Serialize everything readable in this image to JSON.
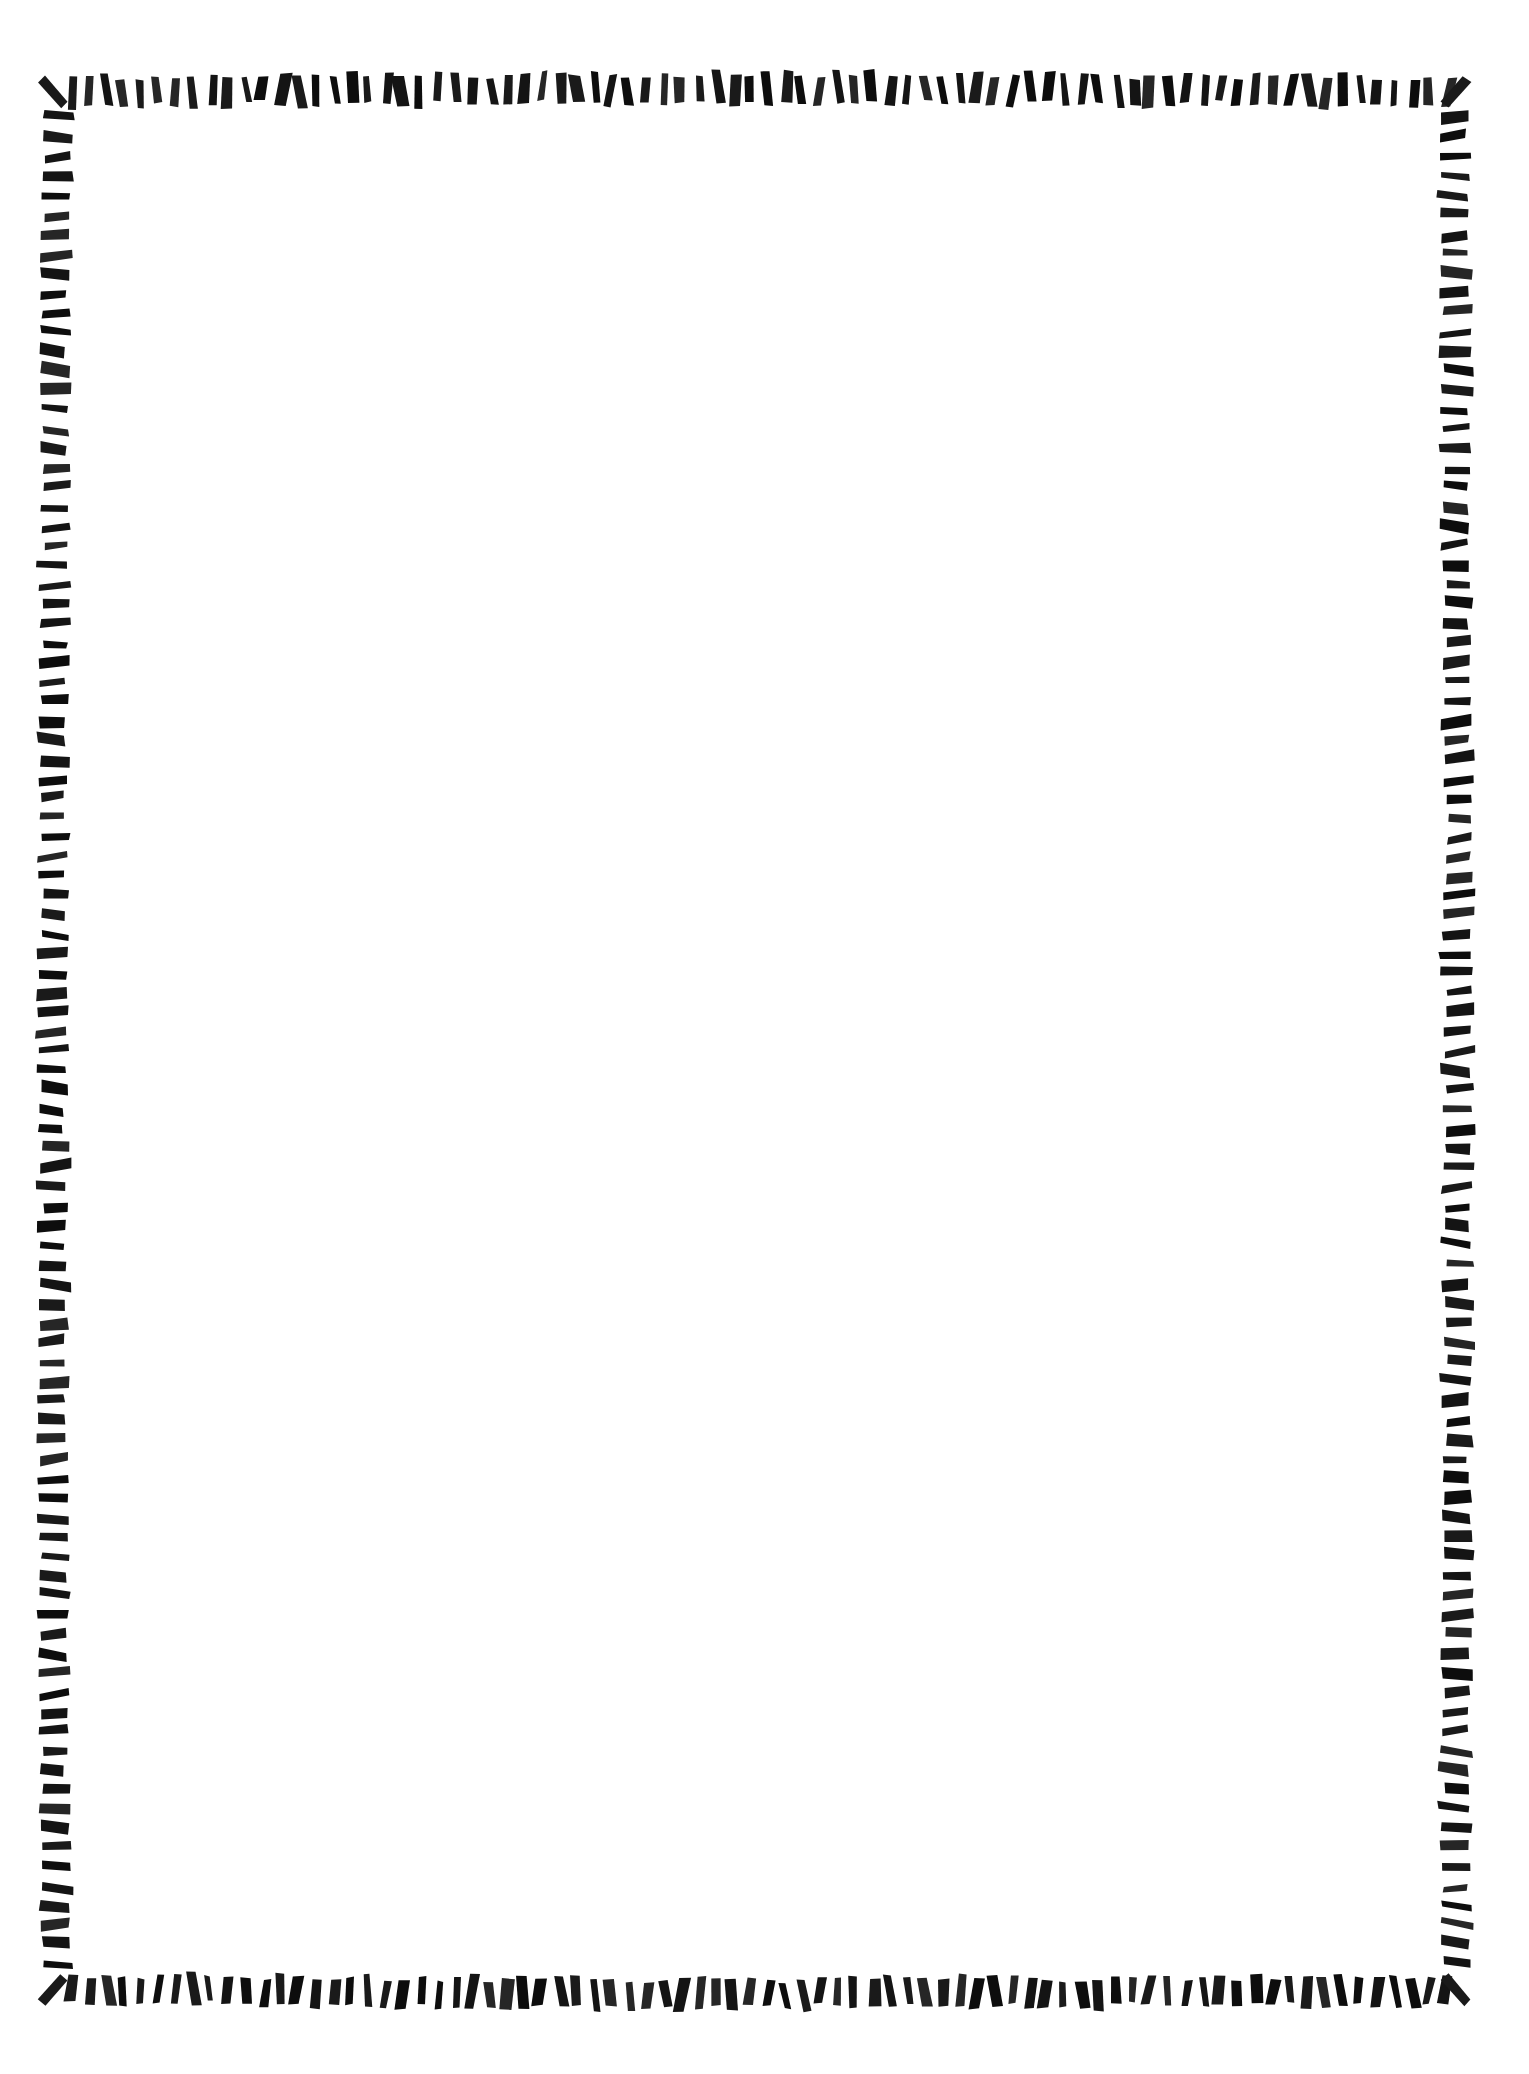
{
  "page": {
    "width": 1529,
    "height": 2074,
    "background_color": "#ffffff",
    "ink_color": "#1a1a1a",
    "body_text": "",
    "interior_content": "blank"
  },
  "border": {
    "name": "hand-drawn-tick-mark-frame",
    "style": "irregular hand-inked dashes / tally ticks",
    "ink_color": "#1a1a1a",
    "stroke_color_variation": [
      "#0d0d0d",
      "#1a1a1a",
      "#262626",
      "#141414"
    ],
    "edges": {
      "top": {
        "y_center": 92,
        "x_start": 72,
        "x_end": 1447,
        "dash_count": 80,
        "dash_width": 9,
        "dash_height": 30,
        "spacing": 17.2,
        "orientation": "vertical-ticks"
      },
      "bottom": {
        "y_center": 1990,
        "x_start": 72,
        "x_end": 1447,
        "dash_count": 80,
        "dash_width": 9,
        "dash_height": 30,
        "spacing": 17.2,
        "orientation": "vertical-ticks"
      },
      "left": {
        "x_center": 56,
        "y_start": 118,
        "y_end": 1964,
        "dash_count": 96,
        "dash_width": 29,
        "dash_height": 9,
        "spacing": 19.4,
        "orientation": "horizontal-ticks"
      },
      "right": {
        "x_center": 1455,
        "y_start": 118,
        "y_end": 1964,
        "dash_count": 96,
        "dash_width": 29,
        "dash_height": 9,
        "spacing": 19.4,
        "orientation": "horizontal-ticks"
      }
    },
    "corners": [
      {
        "name": "top-left",
        "x": 53,
        "y": 92,
        "angle": -42
      },
      {
        "name": "top-right",
        "x": 1456,
        "y": 92,
        "angle": 42
      },
      {
        "name": "bottom-left",
        "x": 53,
        "y": 1990,
        "angle": 42
      },
      {
        "name": "bottom-right",
        "x": 1456,
        "y": 1990,
        "angle": -42
      }
    ]
  }
}
